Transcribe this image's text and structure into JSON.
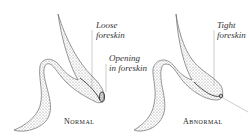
{
  "figure": {
    "panels": [
      {
        "id": "normal",
        "caption": "Normal",
        "labels": [
          {
            "text_line1": "Loose",
            "text_line2": "foreskin"
          },
          {
            "text_line1": "Opening",
            "text_line2": "in foreskin"
          }
        ]
      },
      {
        "id": "abnormal",
        "caption": "Abnormal",
        "labels": [
          {
            "text_line1": "Tight",
            "text_line2": "foreskin"
          }
        ]
      }
    ],
    "colors": {
      "stipple": "#555555",
      "leader_line": "#999999",
      "text": "#333333"
    }
  }
}
